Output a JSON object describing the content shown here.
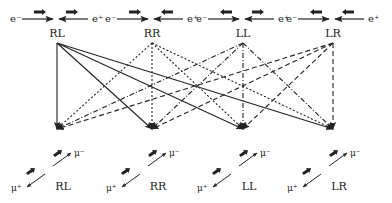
{
  "diagram": {
    "initial_states": [
      {
        "id": "RL",
        "label": "RL",
        "left_particle": "e⁻",
        "right_particle": "e⁺",
        "left_spin": "right",
        "right_spin": "right",
        "x": 57,
        "line_style": "solid"
      },
      {
        "id": "RR",
        "label": "RR",
        "left_particle": "e⁻",
        "right_particle": "e⁺",
        "left_spin": "right",
        "right_spin": "left",
        "x": 152,
        "line_style": "dotted"
      },
      {
        "id": "LL",
        "label": "LL",
        "left_particle": "e⁻",
        "right_particle": "e⁺",
        "left_spin": "left",
        "right_spin": "right",
        "x": 243,
        "line_style": "dash-dot"
      },
      {
        "id": "LR",
        "label": "LR",
        "left_particle": "e⁻",
        "right_particle": "e⁺",
        "left_spin": "left",
        "right_spin": "left",
        "x": 333,
        "line_style": "dashed"
      }
    ],
    "final_states": [
      {
        "id": "RL",
        "label": "RL",
        "top_particle": "μ⁻",
        "bottom_particle": "μ⁺",
        "x": 57
      },
      {
        "id": "RR",
        "label": "RR",
        "top_particle": "μ⁻",
        "bottom_particle": "μ⁺",
        "x": 152
      },
      {
        "id": "LL",
        "label": "LL",
        "top_particle": "μ⁻",
        "bottom_particle": "μ⁺",
        "x": 243
      },
      {
        "id": "LR",
        "label": "LR",
        "top_particle": "μ⁻",
        "bottom_particle": "μ⁺",
        "x": 333
      }
    ],
    "connections": "every initial state connects to every final state",
    "colors": {
      "line": "#222222",
      "text": "#222222"
    }
  }
}
